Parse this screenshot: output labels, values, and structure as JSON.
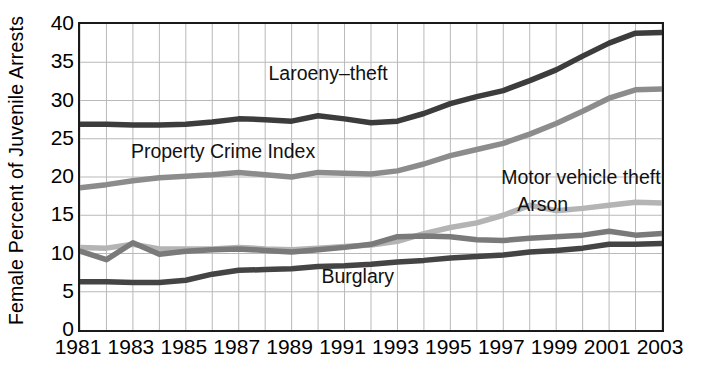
{
  "chart_data": {
    "type": "line",
    "title": "",
    "subtitle": "",
    "xlabel": "",
    "ylabel": "Female Percent of Juvenile Arrests",
    "xlim": [
      1981,
      2003
    ],
    "ylim": [
      0,
      40
    ],
    "grid": true,
    "grid_x_step": 1,
    "grid_y_step": 5,
    "legend_position": "inline-annotations",
    "x": [
      1981,
      1982,
      1983,
      1984,
      1985,
      1986,
      1987,
      1988,
      1989,
      1990,
      1991,
      1992,
      1993,
      1994,
      1995,
      1996,
      1997,
      1998,
      1999,
      2000,
      2001,
      2002,
      2003
    ],
    "ytick_labels": [
      "0",
      "5",
      "10",
      "15",
      "20",
      "25",
      "30",
      "35",
      "40"
    ],
    "ytick_values": [
      0,
      5,
      10,
      15,
      20,
      25,
      30,
      35,
      40
    ],
    "xtick_labels": [
      "1981",
      "1983",
      "1985",
      "1987",
      "1989",
      "1991",
      "1993",
      "1995",
      "1997",
      "1999",
      "2001",
      "2003"
    ],
    "xtick_values": [
      1981,
      1983,
      1985,
      1987,
      1989,
      1991,
      1993,
      1995,
      1997,
      1999,
      2001,
      2003
    ],
    "series": [
      {
        "name": "Laroeny-theft",
        "label": "Laroeny–theft",
        "color": "#3c3c3c",
        "width": 5.5,
        "label_x": 1988.2,
        "label_y": 33.2,
        "values": [
          26.9,
          26.9,
          26.8,
          26.8,
          26.9,
          27.2,
          27.6,
          27.5,
          27.3,
          28.0,
          27.6,
          27.1,
          27.3,
          28.3,
          29.6,
          30.5,
          31.3,
          32.6,
          34.0,
          35.8,
          37.5,
          38.8,
          38.9
        ]
      },
      {
        "name": "Property Crime Index",
        "label": "Property Crime Index",
        "color": "#8c8c8c",
        "width": 5.5,
        "label_x": 1983.0,
        "label_y": 23.0,
        "values": [
          18.6,
          19.0,
          19.5,
          19.9,
          20.1,
          20.3,
          20.6,
          20.3,
          20.0,
          20.6,
          20.5,
          20.4,
          20.8,
          21.7,
          22.8,
          23.6,
          24.4,
          25.6,
          27.0,
          28.6,
          30.3,
          31.4,
          31.5
        ]
      },
      {
        "name": "Motor vehicle theft",
        "label": "Motor vehicle theft",
        "color": "#b4b4b4",
        "width": 5.5,
        "label_x": 1997.0,
        "label_y": 19.6,
        "values": [
          10.8,
          10.7,
          11.2,
          10.6,
          10.6,
          10.6,
          10.8,
          10.6,
          10.5,
          10.7,
          10.9,
          11.1,
          11.6,
          12.6,
          13.4,
          14.0,
          15.0,
          16.3,
          15.6,
          15.9,
          16.3,
          16.7,
          16.6
        ]
      },
      {
        "name": "Arson",
        "label": "Arson",
        "color": "#7a7a7a",
        "width": 5.5,
        "label_x": 1997.6,
        "label_y": 16.1,
        "values": [
          10.3,
          9.2,
          11.4,
          9.9,
          10.3,
          10.5,
          10.6,
          10.4,
          10.2,
          10.5,
          10.8,
          11.2,
          12.2,
          12.3,
          12.2,
          11.8,
          11.7,
          12.0,
          12.2,
          12.4,
          12.9,
          12.4,
          12.6
        ]
      },
      {
        "name": "Burglary",
        "label": "Burglary",
        "color": "#444444",
        "width": 5.5,
        "label_x": 1990.2,
        "label_y": 6.7,
        "values": [
          6.3,
          6.3,
          6.2,
          6.2,
          6.5,
          7.3,
          7.8,
          7.9,
          8.0,
          8.3,
          8.4,
          8.6,
          8.9,
          9.1,
          9.4,
          9.6,
          9.8,
          10.2,
          10.4,
          10.7,
          11.2,
          11.2,
          11.3
        ]
      }
    ]
  },
  "axes": {
    "y_axis_title": "Female Percent of Juvenile Arrests",
    "frame_color": "#1a1a1a",
    "grid_color": "#b9b9b9"
  }
}
